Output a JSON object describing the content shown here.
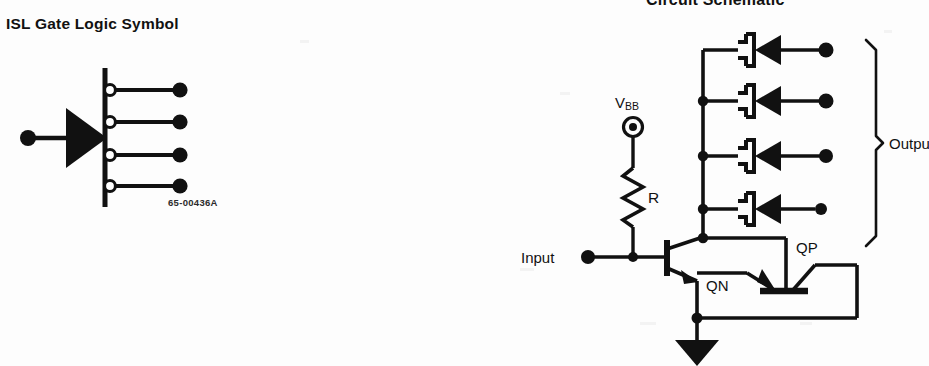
{
  "document": {
    "left_heading": "ISL Gate Logic Symbol",
    "right_heading": "Circuit Schematic",
    "part_number": "65-00436A"
  },
  "logic_symbol": {
    "name": "ISL gate logic symbol",
    "input_terminal_label": "",
    "buffer_shape": "filled-triangle",
    "output_count": 4,
    "output_inversion_bubbles": 4,
    "outputs": [
      {
        "index": 1,
        "bubble": true,
        "terminal": "filled-dot"
      },
      {
        "index": 2,
        "bubble": true,
        "terminal": "filled-dot"
      },
      {
        "index": 3,
        "bubble": true,
        "terminal": "filled-dot"
      },
      {
        "index": 4,
        "bubble": true,
        "terminal": "filled-dot"
      }
    ]
  },
  "schematic": {
    "supply_label": "V",
    "supply_subscript": "BB",
    "resistor_label": "R",
    "input_label": "Input",
    "outputs_label": "Outputs",
    "npn_label": "QN",
    "pnp_label": "QP",
    "diode_count": 4,
    "diode_type": "schottky",
    "ground_symbol": "filled-triangle",
    "output_terminal_count": 4
  }
}
